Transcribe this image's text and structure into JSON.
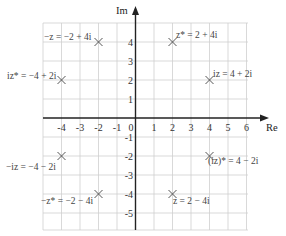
{
  "diagram": {
    "axes": {
      "x_label": "Re",
      "y_label": "Im",
      "x_ticks": [
        "-4",
        "-3",
        "-2",
        "-1",
        "0",
        "1",
        "2",
        "3",
        "4",
        "5",
        "6"
      ],
      "y_ticks_positive": [
        "4",
        "3",
        "2",
        "1"
      ],
      "y_ticks_negative": [
        "-1",
        "-2",
        "-3",
        "-4",
        "-5"
      ]
    },
    "points": [
      {
        "id": "neg-z",
        "re": -2,
        "im": 4,
        "label": "−z = −2 + 4i"
      },
      {
        "id": "z-conj",
        "re": 2,
        "im": 4,
        "label": "z* = 2 + 4i"
      },
      {
        "id": "iz-conj",
        "re": -4,
        "im": 2,
        "label": "iz* = −4 + 2i"
      },
      {
        "id": "iz",
        "re": 4,
        "im": 2,
        "label": "iz = 4 + 2i"
      },
      {
        "id": "neg-iz",
        "re": -4,
        "im": -2,
        "label": "−iz = −4 − 2i"
      },
      {
        "id": "iz-conj-2",
        "re": 4,
        "im": -2,
        "label": "(iz)* = 4 − 2i"
      },
      {
        "id": "neg-z-conj",
        "re": -2,
        "im": -4,
        "label": "−z* = −2 − 4i"
      },
      {
        "id": "z",
        "re": 2,
        "im": -4,
        "label": "z = 2 − 4i"
      }
    ],
    "colors": {
      "grid": "#c8c8c8",
      "axis": "#222222",
      "marker": "#555555",
      "text": "#444444"
    }
  }
}
